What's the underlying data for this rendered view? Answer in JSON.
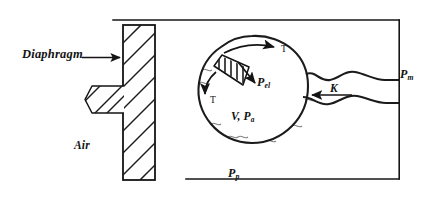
{
  "figure": {
    "domain": "diagram",
    "background_color": "#ffffff",
    "ink_color": "#141414",
    "labels": {
      "diaphragm": "Diaphragm",
      "air": "Air",
      "tension_top": "T",
      "tension_left": "T",
      "elastic_pressure": "P",
      "elastic_pressure_sub": "el",
      "volume": "V",
      "volume_sep": ",",
      "alveolar_pressure": "P",
      "alveolar_pressure_sub": "a",
      "pleural_pressure": "P",
      "pleural_pressure_sub": "p",
      "resistance": "K",
      "mouth_pressure": "P",
      "mouth_pressure_sub": "m",
      "volume_alveolar_combined": "V, P",
      "volume_alveolar_sub": "a"
    },
    "elements": {
      "diaphragm_block": "hatched-rectangle",
      "piston_rod": "hatched-stub",
      "balloon": "wavy-circle",
      "balloon_patch": "hatched-wall-segment",
      "airway_neck": "wavy-duct",
      "chest_wall_frame": "open-rectangle-bracket"
    },
    "arrows": {
      "diaphragm_pointer": "arrow-right",
      "tension_top": "arrow-right-tangential",
      "tension_left": "arrow-down-tangential",
      "elastic_recoil": "arrow-down-right",
      "airflow": "arrow-left"
    }
  }
}
